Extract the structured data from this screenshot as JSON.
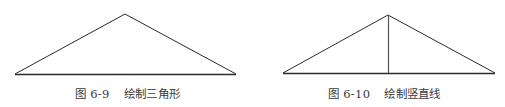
{
  "figures": [
    {
      "id": "left",
      "number": "图 6-9",
      "title": "绘制三角形",
      "shape": "triangle",
      "has_vertical_line": false
    },
    {
      "id": "right",
      "number": "图 6-10",
      "title": "绘制竖直线",
      "shape": "triangle",
      "has_vertical_line": true
    }
  ],
  "colors": {
    "stroke": "#2b2b2b",
    "caption": "#3a3a3a",
    "background": "#ffffff"
  }
}
